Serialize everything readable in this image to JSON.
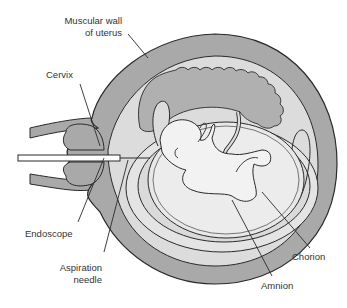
{
  "diagram": {
    "type": "anatomical illustration",
    "colors": {
      "muscle": "#a9a9a9",
      "cavity": "#dcdcdc",
      "placenta": "#b0b0b0",
      "amniotic_fluid": "#e6e6e6",
      "fetus": "#efefef",
      "outline": "#2a2a2a"
    },
    "labels": {
      "muscular_wall_line1": "Muscular wall",
      "muscular_wall_line2": "of uterus",
      "cervix": "Cervix",
      "endoscope": "Endoscope",
      "aspiration_line1": "Aspiration",
      "aspiration_line2": "needle",
      "chorion": "Chorion",
      "amnion": "Amnion"
    }
  }
}
